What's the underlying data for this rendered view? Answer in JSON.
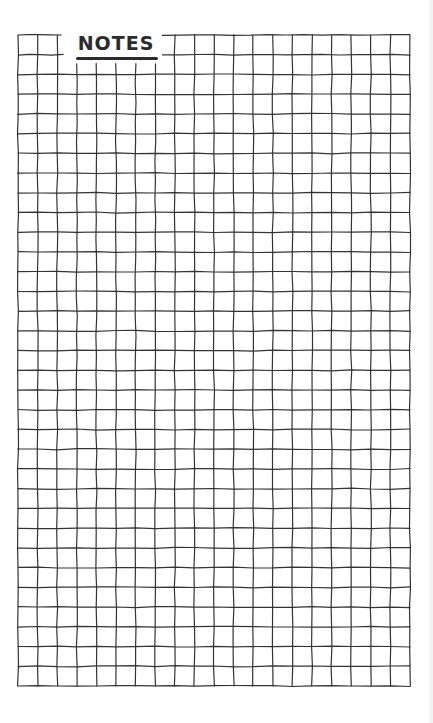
{
  "page": {
    "title": "NOTES",
    "background_color": "#ffffff",
    "line_color": "#333333",
    "title_color": "#2b2b2b"
  },
  "grid": {
    "left": 18,
    "top": 35,
    "right": 410,
    "bottom": 686,
    "columns": 20,
    "rows": 33,
    "title_cell_span": {
      "col_start": 2,
      "col_end": 7,
      "row": 0
    }
  }
}
